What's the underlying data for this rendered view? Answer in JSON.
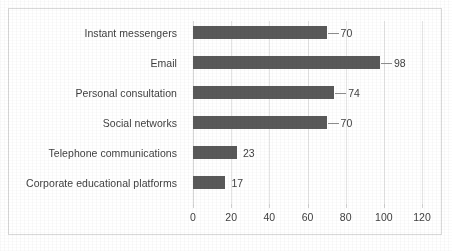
{
  "chart_data": {
    "type": "bar",
    "orientation": "horizontal",
    "title": "",
    "subtitle": "",
    "xlabel": "",
    "ylabel": "",
    "categories": [
      "Instant messengers",
      "Email",
      "Personal consultation",
      "Social networks",
      "Telephone communications",
      "Corporate educational platforms"
    ],
    "values": [
      70,
      98,
      74,
      70,
      23,
      17
    ],
    "value_labels": [
      "70",
      "98",
      "74",
      "70",
      "23",
      "17"
    ],
    "xlim": [
      0,
      120
    ],
    "xticks": [
      0,
      20,
      40,
      60,
      80,
      100,
      120
    ],
    "xtick_labels": [
      "0",
      "20",
      "40",
      "60",
      "80",
      "100",
      "120"
    ],
    "grid": true,
    "grid_axis": "x",
    "legend": false,
    "legend_position": "none",
    "series": [
      {
        "name": "",
        "values": [
          70,
          98,
          74,
          70,
          23,
          17
        ]
      }
    ]
  },
  "style": {
    "bar_color": "#595959",
    "grid_color": "#e4e4e4",
    "text_color": "#3f3f3f",
    "border_color": "#d9d9d9",
    "leader_color": "#8c8c8c",
    "background": "#ffffff"
  }
}
